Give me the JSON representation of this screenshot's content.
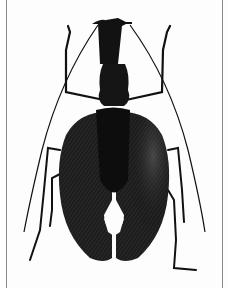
{
  "image": {
    "subject": "violin beetle specimen photograph",
    "style": "black and white",
    "colors": {
      "background": "#fdfdfd",
      "body": "#151515",
      "elytra": "#1e1e1e",
      "border": "#8a8a8a"
    }
  }
}
